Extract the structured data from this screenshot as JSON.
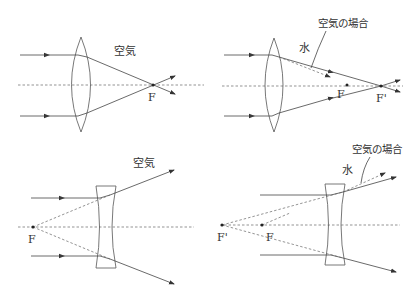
{
  "top_cut_text": "(b)",
  "panels": [
    {
      "id": "convex-air",
      "medium_label": "空気",
      "focus_labels": [
        "F"
      ]
    },
    {
      "id": "convex-water",
      "medium_label": "水",
      "air_case_label": "空気の場合",
      "focus_labels": [
        "F",
        "F'"
      ]
    },
    {
      "id": "concave-air",
      "medium_label": "空気",
      "focus_labels": [
        "F"
      ]
    },
    {
      "id": "concave-water",
      "medium_label": "水",
      "air_case_label": "空気の場合",
      "focus_labels": [
        "F'",
        "F"
      ]
    }
  ],
  "colors": {
    "line": "#444444",
    "dashed": "#666666",
    "text": "#333333"
  }
}
